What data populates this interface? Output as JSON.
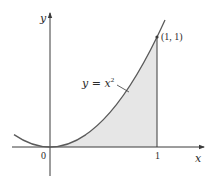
{
  "figure": {
    "axes": {
      "x_label": "x",
      "y_label": "y",
      "origin_label": "0",
      "x_tick_label": "1"
    },
    "curve": {
      "equation_label_base": "y = x",
      "equation_label_exponent": "2",
      "function": "x^2"
    },
    "point": {
      "label": "(1, 1)",
      "x": 1,
      "y": 1
    },
    "shaded_region": {
      "description": "area under y = x^2 from x = 0 to x = 1",
      "x_from": 0,
      "x_to": 1
    },
    "colors": {
      "curve": "#5a5a5a",
      "axes": "#3a3a3a",
      "fill": "#e6e6e6",
      "text": "#2b2b2b"
    }
  }
}
